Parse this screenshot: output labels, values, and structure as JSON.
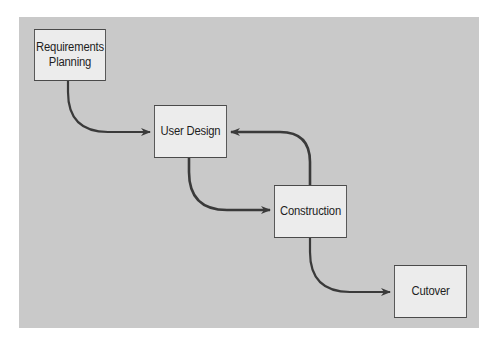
{
  "diagram": {
    "type": "flow",
    "title": "",
    "colors": {
      "page_background": "#ffffff",
      "panel_background": "#c9c9c9",
      "box_fill": "#ececec",
      "box_border": "#4a4a4a",
      "arrow": "#3a3a3a",
      "text": "#1e1e1e"
    },
    "nodes": [
      {
        "id": "requirements-planning",
        "label": "Requirements\nPlanning"
      },
      {
        "id": "user-design",
        "label": "User Design"
      },
      {
        "id": "construction",
        "label": "Construction"
      },
      {
        "id": "cutover",
        "label": "Cutover"
      }
    ],
    "edges": [
      {
        "from": "requirements-planning",
        "to": "user-design"
      },
      {
        "from": "user-design",
        "to": "construction"
      },
      {
        "from": "construction",
        "to": "user-design"
      },
      {
        "from": "construction",
        "to": "cutover"
      }
    ]
  }
}
